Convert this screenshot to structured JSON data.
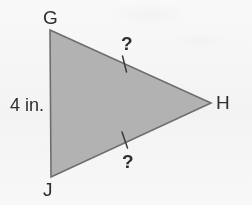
{
  "diagram": {
    "type": "triangle",
    "colors": {
      "background": "#fbfbfb",
      "fill": "#b2b2b2",
      "stroke": "#6e6e6e",
      "text": "#2e2e2e"
    },
    "vertices": [
      {
        "name": "G",
        "label": "G",
        "x": 50,
        "y": 30
      },
      {
        "name": "H",
        "label": "H",
        "x": 211,
        "y": 103
      },
      {
        "name": "J",
        "label": "J",
        "x": 51,
        "y": 177
      }
    ],
    "sides": [
      {
        "name": "GJ",
        "label": "4 in.",
        "known": true
      },
      {
        "name": "GH",
        "label": "?",
        "known": false,
        "tick_marks": 1
      },
      {
        "name": "JH",
        "label": "?",
        "known": false,
        "tick_marks": 1
      }
    ],
    "labels": {
      "vertex_g": "G",
      "vertex_h": "H",
      "vertex_j": "J",
      "side_gj": "4 in.",
      "side_gh": "?",
      "side_jh": "?"
    },
    "tick_marks": [
      {
        "name": "tick-gh",
        "x1": 122,
        "y1": 56,
        "x2": 127,
        "y2": 72
      },
      {
        "name": "tick-jh",
        "x1": 122,
        "y1": 132,
        "x2": 128,
        "y2": 148
      }
    ]
  }
}
